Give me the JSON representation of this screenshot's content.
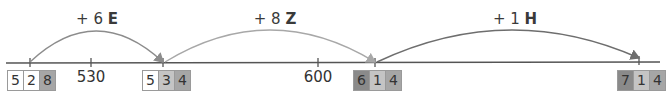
{
  "jumps": [
    {
      "label_prefix": "+ 6",
      "label_unit": "E",
      "x_from": 30,
      "x_to": 163,
      "color": "#8c8c8c"
    },
    {
      "label_prefix": "+ 8",
      "label_unit": "Z",
      "x_from": 163,
      "x_to": 375,
      "color": "#a8a8a8"
    },
    {
      "label_prefix": "+ 1",
      "label_unit": "H",
      "x_from": 375,
      "x_to": 639,
      "color": "#6e6e6e"
    }
  ],
  "ticks": [
    {
      "value": "530",
      "x": 91
    },
    {
      "value": "600",
      "x": 318
    }
  ],
  "numbers": [
    {
      "x": 7,
      "digits": [
        "5",
        "2",
        "8"
      ],
      "colors": [
        "#ffffff",
        "#ffffff",
        "#a6a6a6"
      ]
    },
    {
      "x": 142,
      "digits": [
        "5",
        "3",
        "4"
      ],
      "colors": [
        "#ffffff",
        "#c4c4c4",
        "#a6a6a6"
      ]
    },
    {
      "x": 353,
      "digits": [
        "6",
        "1",
        "4"
      ],
      "colors": [
        "#8a8a8a",
        "#c4c4c4",
        "#a6a6a6"
      ]
    },
    {
      "x": 617,
      "digits": [
        "7",
        "1",
        "4"
      ],
      "colors": [
        "#8a8a8a",
        "#c4c4c4",
        "#a6a6a6"
      ]
    }
  ]
}
